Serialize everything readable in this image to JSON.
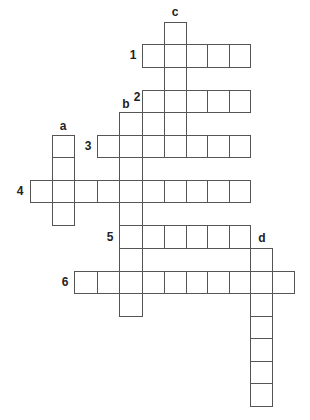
{
  "puzzle": {
    "type": "crossword",
    "cell_border_color": "#555555",
    "label_color": "#222222",
    "columns_x": [
      30,
      52,
      74,
      97,
      119,
      142,
      164,
      186,
      207,
      229,
      250,
      272
    ],
    "rows_y": [
      22,
      44,
      67,
      90,
      112,
      135,
      157,
      180,
      202,
      225,
      248,
      271,
      293,
      316,
      338,
      361,
      383
    ],
    "cell_w": 22,
    "cell_h": 23,
    "entries": [
      {
        "label": "1",
        "direction": "across",
        "row": 1,
        "col": 5,
        "length": 5,
        "label_x": 133,
        "label_y": 55
      },
      {
        "label": "2",
        "direction": "across",
        "row": 3,
        "col": 5,
        "length": 5,
        "label_x": 137,
        "label_y": 97
      },
      {
        "label": "3",
        "direction": "across",
        "row": 5,
        "col": 3,
        "length": 7,
        "label_x": 88,
        "label_y": 146
      },
      {
        "label": "4",
        "direction": "across",
        "row": 7,
        "col": 0,
        "length": 10,
        "label_x": 20,
        "label_y": 191
      },
      {
        "label": "5",
        "direction": "across",
        "row": 9,
        "col": 4,
        "length": 6,
        "label_x": 110,
        "label_y": 237
      },
      {
        "label": "6",
        "direction": "across",
        "row": 11,
        "col": 2,
        "length": 10,
        "label_x": 65,
        "label_y": 282
      },
      {
        "label": "a",
        "direction": "down",
        "row": 5,
        "col": 1,
        "length": 4,
        "label_x": 63,
        "label_y": 126
      },
      {
        "label": "b",
        "direction": "down",
        "row": 4,
        "col": 4,
        "length": 9,
        "label_x": 126,
        "label_y": 104
      },
      {
        "label": "c",
        "direction": "down",
        "row": 0,
        "col": 6,
        "length": 6,
        "label_x": 175,
        "label_y": 12
      },
      {
        "label": "d",
        "direction": "down",
        "row": 10,
        "col": 10,
        "length": 7,
        "label_x": 262,
        "label_y": 238
      }
    ]
  }
}
